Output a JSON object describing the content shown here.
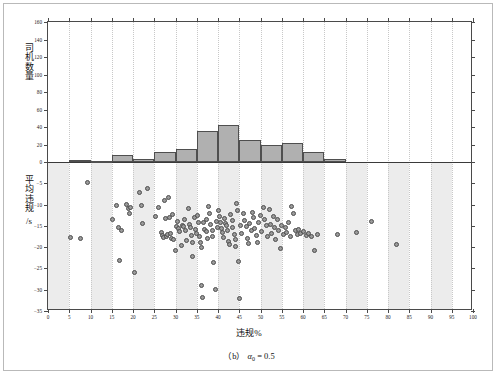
{
  "figure": {
    "caption_prefix": "（b）",
    "caption_symbol": "α",
    "caption_subscript": "0",
    "caption_value": "= 0.5",
    "caption_full": "（b） α0 = 0.5"
  },
  "axes": {
    "x_title": "违规%",
    "y_title_top": "司机数量",
    "y_title_bottom": "平均违规 /s",
    "y_title_bottom_line1": "平均违规",
    "y_title_bottom_line2": "/s"
  },
  "chart_data": {
    "type": "bar",
    "title": "",
    "subtitle": "",
    "xlabel": "违规%",
    "ylabel": "司机数量",
    "xlim": [
      0,
      100
    ],
    "grid": true,
    "legend": false,
    "x_ticks": [
      0,
      5,
      10,
      15,
      20,
      25,
      30,
      35,
      40,
      45,
      50,
      55,
      60,
      65,
      70,
      75,
      80,
      85,
      90,
      95,
      100
    ],
    "panels": [
      {
        "name": "histogram",
        "type": "bar",
        "ylabel": "司机数量",
        "ylim": [
          0,
          160
        ],
        "y_ticks": [
          0,
          20,
          40,
          60,
          80,
          100,
          120,
          140,
          160
        ],
        "bin_width": 5,
        "bin_starts": [
          0,
          5,
          10,
          15,
          20,
          25,
          30,
          35,
          40,
          45,
          50,
          55,
          60,
          65,
          70,
          75,
          80,
          85,
          90,
          95
        ],
        "values": [
          0,
          2,
          1,
          8,
          4,
          12,
          15,
          35,
          42,
          25,
          20,
          22,
          12,
          4,
          0,
          0,
          0,
          0,
          0,
          0
        ]
      },
      {
        "name": "scatter",
        "type": "scatter",
        "ylabel": "平均违规 /s",
        "ylim": [
          -35,
          0
        ],
        "y_ticks": [
          0,
          -5,
          -10,
          -15,
          -20,
          -25,
          -30,
          -35
        ],
        "points": [
          [
            5.4,
            -17.8
          ],
          [
            7.6,
            -17.9
          ],
          [
            9.3,
            -4.8
          ],
          [
            15.2,
            -13.5
          ],
          [
            16.2,
            -10.2
          ],
          [
            16.6,
            -15.5
          ],
          [
            16.9,
            -23.2
          ],
          [
            17.4,
            -16.0
          ],
          [
            18.4,
            -10.0
          ],
          [
            19.0,
            -11.0
          ],
          [
            19.2,
            -12.0
          ],
          [
            19.4,
            -10.6
          ],
          [
            20.3,
            -26.0
          ],
          [
            21.6,
            -7.1
          ],
          [
            22.1,
            -10.3
          ],
          [
            22.3,
            -14.4
          ],
          [
            23.3,
            -6.3
          ],
          [
            25.2,
            -12.9
          ],
          [
            26.0,
            -10.6
          ],
          [
            26.6,
            -16.5
          ],
          [
            26.9,
            -17.3
          ],
          [
            27.2,
            -17.8
          ],
          [
            27.4,
            -9.0
          ],
          [
            27.6,
            -13.2
          ],
          [
            27.9,
            -17.6
          ],
          [
            28.2,
            -17.1
          ],
          [
            28.4,
            -8.3
          ],
          [
            28.6,
            -13.0
          ],
          [
            28.8,
            -16.8
          ],
          [
            29.1,
            -17.9
          ],
          [
            29.4,
            -12.3
          ],
          [
            29.6,
            -18.2
          ],
          [
            29.9,
            -20.7
          ],
          [
            30.2,
            -15.2
          ],
          [
            30.5,
            -14.0
          ],
          [
            30.8,
            -15.6
          ],
          [
            31.0,
            -16.3
          ],
          [
            31.3,
            -19.7
          ],
          [
            31.6,
            -14.8
          ],
          [
            31.9,
            -15.1
          ],
          [
            32.2,
            -13.4
          ],
          [
            32.4,
            -16.0
          ],
          [
            32.7,
            -18.4
          ],
          [
            33.0,
            -11.0
          ],
          [
            33.2,
            -14.6
          ],
          [
            33.5,
            -15.4
          ],
          [
            33.7,
            -17.2
          ],
          [
            33.9,
            -19.0
          ],
          [
            34.1,
            -22.2
          ],
          [
            34.4,
            -13.1
          ],
          [
            34.6,
            -15.8
          ],
          [
            34.9,
            -16.9
          ],
          [
            35.2,
            -12.6
          ],
          [
            35.4,
            -14.3
          ],
          [
            35.6,
            -17.5
          ],
          [
            35.8,
            -18.8
          ],
          [
            36.0,
            -20.1
          ],
          [
            36.2,
            -29.0
          ],
          [
            36.4,
            -31.8
          ],
          [
            36.6,
            -14.1
          ],
          [
            36.9,
            -15.9
          ],
          [
            37.2,
            -13.6
          ],
          [
            37.4,
            -16.4
          ],
          [
            37.6,
            -18.0
          ],
          [
            37.8,
            -10.5
          ],
          [
            38.0,
            -12.2
          ],
          [
            38.3,
            -14.7
          ],
          [
            38.6,
            -16.1
          ],
          [
            38.8,
            -17.4
          ],
          [
            39.0,
            -23.5
          ],
          [
            39.3,
            -30.0
          ],
          [
            39.6,
            -13.9
          ],
          [
            39.8,
            -15.3
          ],
          [
            40.1,
            -11.3
          ],
          [
            40.3,
            -12.8
          ],
          [
            40.5,
            -14.2
          ],
          [
            40.8,
            -15.7
          ],
          [
            41.0,
            -16.6
          ],
          [
            41.3,
            -17.7
          ],
          [
            41.5,
            -13.3
          ],
          [
            41.8,
            -14.5
          ],
          [
            42.0,
            -15.0
          ],
          [
            42.3,
            -16.2
          ],
          [
            42.5,
            -18.6
          ],
          [
            42.8,
            -19.4
          ],
          [
            43.0,
            -12.4
          ],
          [
            43.3,
            -13.8
          ],
          [
            43.5,
            -15.5
          ],
          [
            43.8,
            -17.0
          ],
          [
            44.0,
            -18.3
          ],
          [
            44.2,
            -19.9
          ],
          [
            44.4,
            -9.7
          ],
          [
            44.6,
            -11.5
          ],
          [
            44.8,
            -23.4
          ],
          [
            45.0,
            -32.0
          ],
          [
            45.3,
            -14.9
          ],
          [
            45.6,
            -16.7
          ],
          [
            46.0,
            -12.1
          ],
          [
            46.3,
            -13.7
          ],
          [
            46.6,
            -15.2
          ],
          [
            46.9,
            -17.9
          ],
          [
            47.2,
            -19.2
          ],
          [
            47.5,
            -14.4
          ],
          [
            47.8,
            -16.0
          ],
          [
            48.1,
            -11.8
          ],
          [
            48.4,
            -13.0
          ],
          [
            48.7,
            -15.6
          ],
          [
            49.0,
            -17.3
          ],
          [
            49.3,
            -18.9
          ],
          [
            49.6,
            -14.1
          ],
          [
            50.0,
            -12.5
          ],
          [
            50.3,
            -16.4
          ],
          [
            50.6,
            -10.6
          ],
          [
            51.0,
            -13.4
          ],
          [
            51.3,
            -15.0
          ],
          [
            51.6,
            -17.6
          ],
          [
            52.0,
            -11.2
          ],
          [
            52.3,
            -14.6
          ],
          [
            52.6,
            -16.8
          ],
          [
            53.0,
            -12.9
          ],
          [
            53.3,
            -15.4
          ],
          [
            53.6,
            -18.1
          ],
          [
            54.0,
            -13.6
          ],
          [
            54.3,
            -16.2
          ],
          [
            54.6,
            -20.4
          ],
          [
            55.0,
            -14.8
          ],
          [
            55.4,
            -17.0
          ],
          [
            55.8,
            -15.5
          ],
          [
            56.2,
            -16.6
          ],
          [
            56.6,
            -14.3
          ],
          [
            57.0,
            -17.4
          ],
          [
            57.4,
            -10.5
          ],
          [
            57.8,
            -12.2
          ],
          [
            58.2,
            -16.0
          ],
          [
            58.6,
            -17.1
          ],
          [
            59.0,
            -15.8
          ],
          [
            59.4,
            -16.9
          ],
          [
            60.2,
            -16.4
          ],
          [
            60.8,
            -17.2
          ],
          [
            61.4,
            -16.7
          ],
          [
            62.0,
            -17.5
          ],
          [
            62.6,
            -20.8
          ],
          [
            63.4,
            -17.0
          ],
          [
            68.0,
            -17.1
          ],
          [
            72.5,
            -16.6
          ],
          [
            76.2,
            -14.0
          ],
          [
            82.0,
            -19.4
          ]
        ]
      }
    ]
  },
  "colors": {
    "bar_fill": "#b0b0b0",
    "bar_edge": "#4f4f4f",
    "dot_fill": "#9a9a9a",
    "dot_edge": "#4d4d4d",
    "band": "#ececec",
    "axis": "#4a4a4a",
    "grid": "#d0d0d0",
    "frame": "#b9b9b9"
  }
}
